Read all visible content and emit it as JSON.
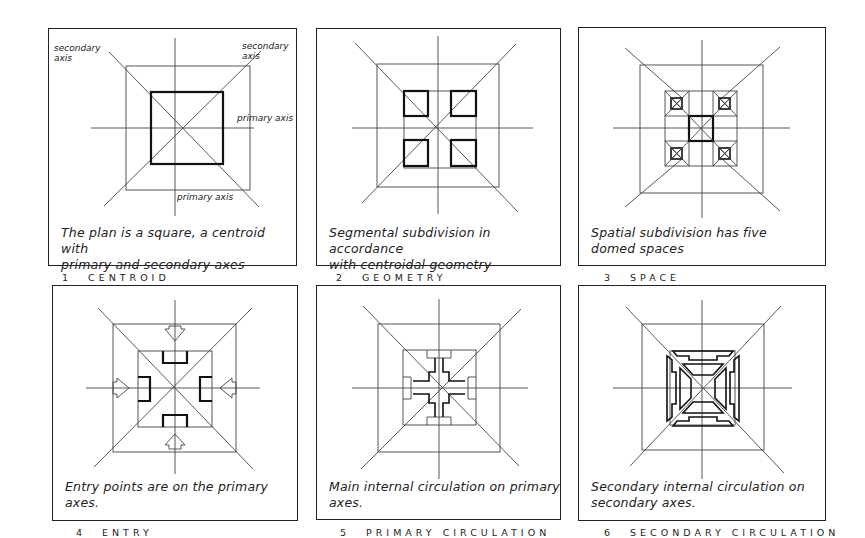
{
  "figure": {
    "panels": [
      {
        "number": "1",
        "title": "CENTROID",
        "caption": "The plan is a square, a centroid with\nprimary and secondary axes",
        "annotations": {
          "secondary_axis_left": "secondary\naxis",
          "secondary_axis_right": "secondary\naxis",
          "primary_axis_right": "primary axis",
          "primary_axis_bottom": "primary axis"
        }
      },
      {
        "number": "2",
        "title": "GEOMETRY",
        "caption": "Segmental subdivision in accordance\nwith centroidal geometry"
      },
      {
        "number": "3",
        "title": "SPACE",
        "caption": "Spatial subdivision has five\ndomed spaces"
      },
      {
        "number": "4",
        "title": "ENTRY",
        "caption": "Entry points are on the primary\naxes."
      },
      {
        "number": "5",
        "title": "PRIMARY CIRCULATION",
        "caption": "Main internal circulation on primary\naxes."
      },
      {
        "number": "6",
        "title": "SECONDARY CIRCULATION",
        "caption": "Secondary internal circulation on\nsecondary axes."
      }
    ]
  }
}
